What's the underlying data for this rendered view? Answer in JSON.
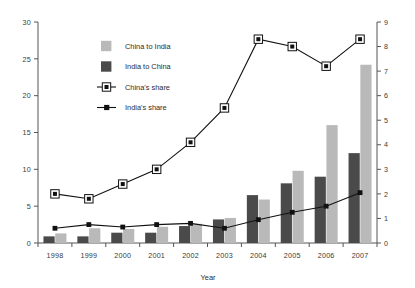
{
  "chart_data": {
    "type": "bar",
    "title": "",
    "xlabel": "Year",
    "ylabel": "",
    "categories": [
      "1998",
      "1999",
      "2000",
      "2001",
      "2002",
      "2003",
      "2004",
      "2005",
      "2006",
      "2007"
    ],
    "left_axis": {
      "min": 0,
      "max": 30,
      "step": 5,
      "ticks": [
        "0",
        "5",
        "10",
        "15",
        "20",
        "25",
        "30"
      ]
    },
    "right_axis": {
      "min": 0,
      "max": 9,
      "step": 1,
      "ticks": [
        "0",
        "1",
        "2",
        "3",
        "4",
        "5",
        "6",
        "7",
        "8",
        "9"
      ]
    },
    "grid": false,
    "legend_position": "top-left-inside",
    "series": [
      {
        "name": "China to India",
        "kind": "bar",
        "axis": "left",
        "color": "#b9b9b9",
        "values": [
          1.3,
          2.0,
          1.9,
          2.2,
          2.6,
          3.4,
          5.9,
          9.8,
          16.0,
          24.2
        ]
      },
      {
        "name": "India to China",
        "kind": "bar",
        "axis": "left",
        "color": "#4a4a4a",
        "values": [
          0.9,
          0.9,
          1.4,
          1.4,
          2.3,
          3.2,
          6.5,
          8.1,
          9.0,
          12.2
        ]
      },
      {
        "name": "China's share",
        "kind": "line",
        "axis": "right",
        "color": "#111111",
        "marker": "open-square",
        "values": [
          2.0,
          1.8,
          2.4,
          3.0,
          4.1,
          5.5,
          8.3,
          8.0,
          7.2,
          8.3
        ]
      },
      {
        "name": "India's share",
        "kind": "line",
        "axis": "right",
        "color": "#111111",
        "marker": "filled-square",
        "values": [
          0.6,
          0.75,
          0.65,
          0.75,
          0.8,
          0.6,
          0.95,
          1.25,
          1.5,
          2.05
        ]
      }
    ]
  },
  "legend": {
    "items": [
      {
        "label": "China to India",
        "swatch": "light-square-swatch"
      },
      {
        "label": "India to China",
        "swatch": "dark-square-swatch"
      },
      {
        "label": "China's share",
        "swatch": "open-square-marker"
      },
      {
        "label": "India's share",
        "swatch": "filled-square-marker"
      }
    ]
  },
  "colors": {
    "light_bar": "#b9b9b9",
    "dark_bar": "#4a4a4a",
    "line": "#111111",
    "axis": "#555555",
    "text": "#2b2b2b",
    "background": "#ffffff"
  }
}
